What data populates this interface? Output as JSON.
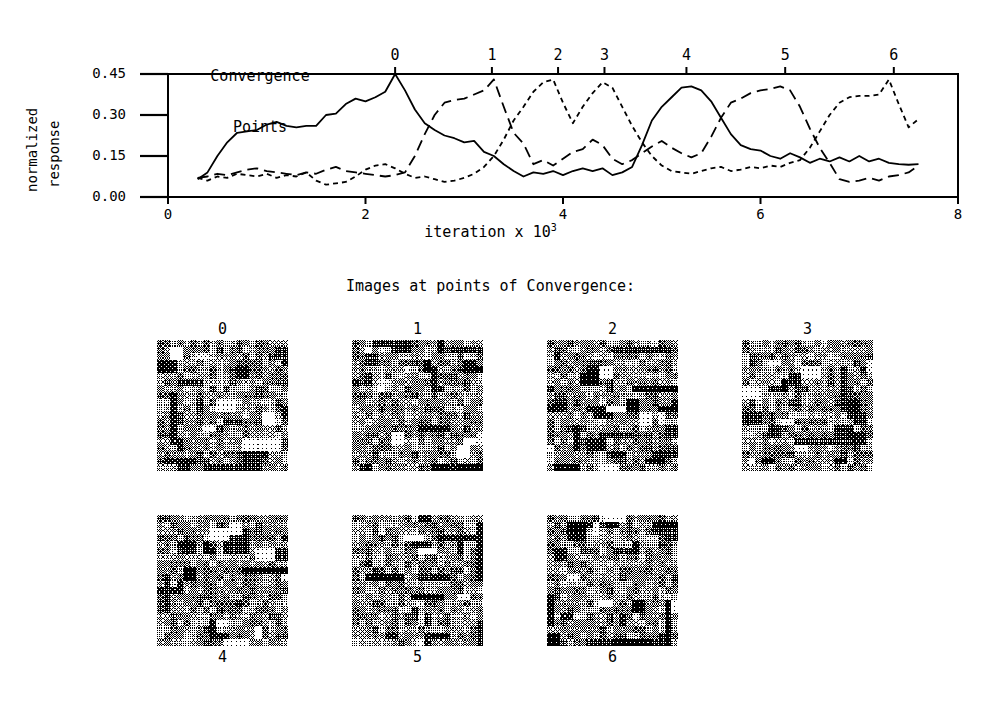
{
  "chart_data": {
    "type": "line",
    "title": "",
    "xlabel": "iteration x 10",
    "xlabel_exponent": "3",
    "ylabel_line1": "normalized",
    "ylabel_line2": "response",
    "xlim": [
      0,
      8
    ],
    "ylim": [
      0.0,
      0.45
    ],
    "xticks": [
      "0",
      "2",
      "4",
      "6",
      "8"
    ],
    "xtick_values": [
      0,
      2,
      4,
      6,
      8
    ],
    "yticks": [
      "0.00",
      "0.15",
      "0.30",
      "0.45"
    ],
    "ytick_values": [
      0.0,
      0.15,
      0.3,
      0.45
    ],
    "grid": false,
    "legend": "none",
    "top_axis_title_line1": "Convergence",
    "top_axis_title_line2": "Points",
    "convergence_points": [
      {
        "label": "0",
        "x": 2.3
      },
      {
        "label": "1",
        "x": 3.28
      },
      {
        "label": "2",
        "x": 3.95
      },
      {
        "label": "3",
        "x": 4.42
      },
      {
        "label": "4",
        "x": 5.25
      },
      {
        "label": "5",
        "x": 6.25
      },
      {
        "label": "6",
        "x": 7.35
      }
    ],
    "series": [
      {
        "name": "unit-a",
        "style": "solid",
        "x": [
          0.3,
          0.4,
          0.5,
          0.6,
          0.7,
          0.8,
          0.9,
          1.0,
          1.1,
          1.2,
          1.3,
          1.4,
          1.5,
          1.6,
          1.7,
          1.8,
          1.9,
          2.0,
          2.1,
          2.2,
          2.3,
          2.4,
          2.5,
          2.6,
          2.7,
          2.8,
          2.9,
          3.0,
          3.1,
          3.2,
          3.3,
          3.4,
          3.5,
          3.6,
          3.7,
          3.8,
          3.9,
          4.0,
          4.1,
          4.2,
          4.3,
          4.4,
          4.5,
          4.6,
          4.7,
          4.8,
          4.9,
          5.0,
          5.1,
          5.2,
          5.3,
          5.4,
          5.5,
          5.6,
          5.7,
          5.8,
          5.9,
          6.0,
          6.1,
          6.2,
          6.3,
          6.4,
          6.5,
          6.6,
          6.7,
          6.8,
          6.9,
          7.0,
          7.1,
          7.2,
          7.3,
          7.4,
          7.5,
          7.6
        ],
        "y": [
          0.065,
          0.09,
          0.15,
          0.2,
          0.235,
          0.24,
          0.245,
          0.265,
          0.275,
          0.26,
          0.255,
          0.26,
          0.26,
          0.3,
          0.305,
          0.34,
          0.36,
          0.35,
          0.365,
          0.385,
          0.45,
          0.39,
          0.32,
          0.27,
          0.245,
          0.225,
          0.215,
          0.2,
          0.205,
          0.165,
          0.15,
          0.12,
          0.095,
          0.075,
          0.09,
          0.085,
          0.095,
          0.08,
          0.095,
          0.105,
          0.095,
          0.105,
          0.08,
          0.09,
          0.11,
          0.19,
          0.28,
          0.33,
          0.365,
          0.4,
          0.405,
          0.39,
          0.35,
          0.29,
          0.23,
          0.19,
          0.175,
          0.17,
          0.15,
          0.14,
          0.16,
          0.145,
          0.125,
          0.14,
          0.13,
          0.145,
          0.13,
          0.15,
          0.13,
          0.14,
          0.125,
          0.12,
          0.118,
          0.12
        ],
        "linewidth": 1.8
      },
      {
        "name": "unit-b",
        "style": "dashed",
        "x": [
          0.3,
          0.4,
          0.5,
          0.6,
          0.7,
          0.8,
          0.9,
          1.0,
          1.1,
          1.2,
          1.3,
          1.4,
          1.5,
          1.6,
          1.7,
          1.8,
          1.9,
          2.0,
          2.1,
          2.2,
          2.3,
          2.4,
          2.5,
          2.6,
          2.7,
          2.8,
          2.9,
          3.0,
          3.1,
          3.2,
          3.3,
          3.4,
          3.5,
          3.6,
          3.7,
          3.8,
          3.9,
          4.0,
          4.1,
          4.2,
          4.3,
          4.4,
          4.5,
          4.6,
          4.7,
          4.8,
          4.9,
          5.0,
          5.1,
          5.2,
          5.3,
          5.4,
          5.5,
          5.6,
          5.7,
          5.8,
          5.9,
          6.0,
          6.1,
          6.2,
          6.3,
          6.4,
          6.5,
          6.6,
          6.7,
          6.8,
          6.9,
          7.0,
          7.1,
          7.2,
          7.3,
          7.4,
          7.5,
          7.6
        ],
        "y": [
          0.07,
          0.075,
          0.085,
          0.08,
          0.09,
          0.1,
          0.105,
          0.095,
          0.09,
          0.085,
          0.08,
          0.09,
          0.085,
          0.1,
          0.11,
          0.095,
          0.09,
          0.085,
          0.08,
          0.075,
          0.08,
          0.09,
          0.15,
          0.23,
          0.3,
          0.345,
          0.355,
          0.36,
          0.375,
          0.39,
          0.43,
          0.33,
          0.235,
          0.195,
          0.12,
          0.135,
          0.115,
          0.14,
          0.165,
          0.175,
          0.21,
          0.19,
          0.14,
          0.12,
          0.135,
          0.16,
          0.185,
          0.205,
          0.18,
          0.16,
          0.145,
          0.16,
          0.22,
          0.29,
          0.345,
          0.36,
          0.38,
          0.39,
          0.395,
          0.405,
          0.39,
          0.33,
          0.25,
          0.18,
          0.125,
          0.065,
          0.055,
          0.06,
          0.07,
          0.06,
          0.075,
          0.08,
          0.09,
          0.115
        ],
        "linewidth": 1.8
      },
      {
        "name": "unit-c",
        "style": "dotted",
        "x": [
          0.3,
          0.4,
          0.5,
          0.6,
          0.7,
          0.8,
          0.9,
          1.0,
          1.1,
          1.2,
          1.3,
          1.4,
          1.5,
          1.6,
          1.7,
          1.8,
          1.9,
          2.0,
          2.1,
          2.2,
          2.3,
          2.4,
          2.5,
          2.6,
          2.7,
          2.8,
          2.9,
          3.0,
          3.1,
          3.2,
          3.3,
          3.4,
          3.5,
          3.6,
          3.7,
          3.8,
          3.9,
          4.0,
          4.1,
          4.2,
          4.3,
          4.4,
          4.5,
          4.6,
          4.7,
          4.8,
          4.9,
          5.0,
          5.1,
          5.2,
          5.3,
          5.4,
          5.5,
          5.6,
          5.7,
          5.8,
          5.9,
          6.0,
          6.1,
          6.2,
          6.3,
          6.4,
          6.5,
          6.6,
          6.7,
          6.8,
          6.9,
          7.0,
          7.1,
          7.2,
          7.3,
          7.4,
          7.5,
          7.6
        ],
        "y": [
          0.07,
          0.06,
          0.075,
          0.07,
          0.085,
          0.08,
          0.075,
          0.085,
          0.07,
          0.08,
          0.075,
          0.09,
          0.06,
          0.045,
          0.05,
          0.055,
          0.075,
          0.1,
          0.115,
          0.12,
          0.105,
          0.085,
          0.07,
          0.075,
          0.065,
          0.055,
          0.06,
          0.07,
          0.085,
          0.11,
          0.15,
          0.21,
          0.28,
          0.33,
          0.385,
          0.42,
          0.43,
          0.345,
          0.27,
          0.33,
          0.38,
          0.42,
          0.4,
          0.33,
          0.26,
          0.2,
          0.15,
          0.115,
          0.095,
          0.09,
          0.085,
          0.095,
          0.105,
          0.11,
          0.095,
          0.1,
          0.11,
          0.105,
          0.115,
          0.11,
          0.125,
          0.135,
          0.18,
          0.24,
          0.3,
          0.345,
          0.365,
          0.37,
          0.37,
          0.375,
          0.43,
          0.34,
          0.255,
          0.285
        ],
        "linewidth": 1.8
      }
    ]
  },
  "images_section": {
    "caption": "Images at points of Convergence:",
    "tiles": [
      {
        "label": "0",
        "label_position": "above",
        "seed": 11
      },
      {
        "label": "1",
        "label_position": "above",
        "seed": 23
      },
      {
        "label": "2",
        "label_position": "above",
        "seed": 37
      },
      {
        "label": "3",
        "label_position": "above",
        "seed": 51
      },
      {
        "label": "4",
        "label_position": "below",
        "seed": 67
      },
      {
        "label": "5",
        "label_position": "below",
        "seed": 83
      },
      {
        "label": "6",
        "label_position": "below",
        "seed": 97
      }
    ]
  },
  "colors": {
    "ink": "#000000",
    "paper": "#ffffff"
  }
}
